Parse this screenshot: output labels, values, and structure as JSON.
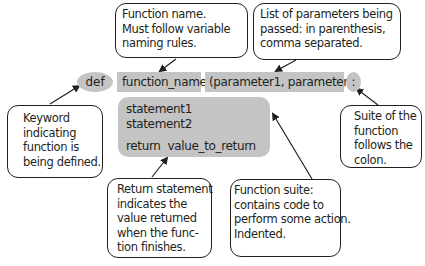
{
  "code": {
    "def_keyword": "def",
    "function_name": "function_name",
    "parameters": "(parameter1, parameter2)",
    "colon": ":",
    "suite_lines": [
      "statement1",
      "statement2",
      "",
      "return  value_to_return"
    ]
  },
  "callouts": {
    "function_name": [
      "Function name.",
      "Must follow variable",
      "naming rules."
    ],
    "parameters": [
      "List of parameters being",
      "passed: in parenthesis,",
      "comma separated."
    ],
    "keyword": [
      "Keyword",
      "indicating",
      "function is",
      "being defined."
    ],
    "colon": [
      "Suite of the",
      "function",
      "follows the",
      "colon."
    ],
    "return": [
      "Return statement",
      "indicates the",
      "value returned",
      "when the func-",
      "tion finishes."
    ],
    "suite": [
      "Function suite:",
      "contains code to",
      "perform some action.",
      "Indented."
    ]
  },
  "colors": {
    "highlight_gray": "#c4c4c4",
    "line": "#231f20",
    "background": "#ffffff"
  }
}
